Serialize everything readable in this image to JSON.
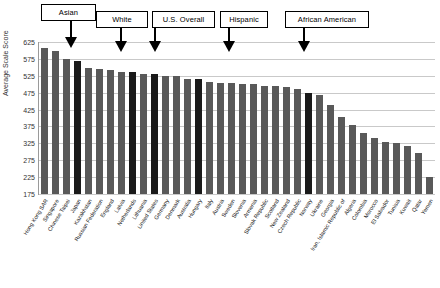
{
  "chart_data": {
    "type": "bar",
    "title": "",
    "xlabel": "",
    "ylabel": "Average Scale Score",
    "ylim": [
      175,
      625
    ],
    "ytick_step": 50,
    "yticks": [
      625,
      575,
      525,
      475,
      425,
      375,
      325,
      275,
      225,
      175
    ],
    "grid": true,
    "legend": "none",
    "bar_color": "#595959",
    "highlight_color": "#1a1a1a",
    "categories": [
      "Hong Kong SAR",
      "Singapore",
      "Chinese Taipei",
      "Japan",
      "Kazakhstan",
      "Russian Federation",
      "England",
      "Latvia",
      "Netherlands",
      "Lithuania",
      "United States",
      "Germany",
      "Denmark",
      "Australia",
      "Hungary",
      "Italy",
      "Austria",
      "Sweden",
      "Slovenia",
      "Armenia",
      "Slovak Republic",
      "Scotland",
      "New Zealand",
      "Czech Republic",
      "Norway",
      "Ukraine",
      "Georgia",
      "Iran, Islamic Republic of",
      "Algeria",
      "Colombia",
      "Morocco",
      "El Salvador",
      "Tunisia",
      "Kuwait",
      "Qatar",
      "Yemen"
    ],
    "values": [
      607,
      599,
      576,
      568,
      549,
      544,
      541,
      537,
      535,
      530,
      529,
      525,
      525,
      516,
      515,
      507,
      505,
      503,
      502,
      500,
      496,
      494,
      492,
      486,
      473,
      469,
      438,
      402,
      378,
      355,
      341,
      330,
      327,
      316,
      296,
      224
    ],
    "highlighted_indices": [
      3,
      10,
      10,
      10,
      10
    ],
    "annotations": [
      {
        "label": "Asian",
        "target_category": "Japan",
        "target_index": 3
      },
      {
        "label": "White",
        "target_category": "Netherlands",
        "target_index": 8
      },
      {
        "label": "U.S. Overall",
        "target_category": "United States",
        "target_index": 10
      },
      {
        "label": "Hispanic",
        "target_category": "Hungary",
        "target_index": 14
      },
      {
        "label": "African American",
        "target_category": "Norway",
        "target_index": 24
      }
    ]
  }
}
